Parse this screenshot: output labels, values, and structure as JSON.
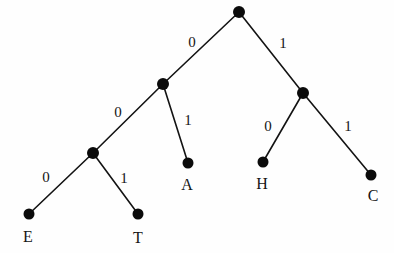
{
  "diagram": {
    "kind": "binary-code-tree",
    "title": "",
    "colors": {
      "background": "#fefefe",
      "node": "#0b0b0b",
      "edge": "#131313",
      "text": "#151515"
    },
    "nodes": [
      {
        "id": "root",
        "x": 239,
        "y": 12,
        "r": 6.0,
        "label": ""
      },
      {
        "id": "n-l",
        "x": 163,
        "y": 84,
        "r": 6.0,
        "label": ""
      },
      {
        "id": "n-r",
        "x": 303,
        "y": 93,
        "r": 6.0,
        "label": ""
      },
      {
        "id": "n-ll",
        "x": 93,
        "y": 153,
        "r": 6.0,
        "label": ""
      },
      {
        "id": "leaf-e",
        "x": 29,
        "y": 214,
        "r": 5.5,
        "label": "E"
      },
      {
        "id": "leaf-t",
        "x": 138,
        "y": 214,
        "r": 5.5,
        "label": "T"
      },
      {
        "id": "leaf-a",
        "x": 188,
        "y": 163,
        "r": 5.5,
        "label": "A"
      },
      {
        "id": "leaf-h",
        "x": 263,
        "y": 162,
        "r": 5.5,
        "label": "H"
      },
      {
        "id": "leaf-c",
        "x": 371,
        "y": 175,
        "r": 5.5,
        "label": "C"
      }
    ],
    "edges": [
      {
        "id": "e-root-l",
        "from": "root",
        "to": "n-l",
        "label": "0",
        "lx": 192,
        "ly": 42
      },
      {
        "id": "e-root-r",
        "from": "root",
        "to": "n-r",
        "label": "1",
        "lx": 283,
        "ly": 43
      },
      {
        "id": "e-l-ll",
        "from": "n-l",
        "to": "n-ll",
        "label": "0",
        "lx": 118,
        "ly": 112
      },
      {
        "id": "e-l-a",
        "from": "n-l",
        "to": "leaf-a",
        "label": "1",
        "lx": 188,
        "ly": 120
      },
      {
        "id": "e-ll-e",
        "from": "n-ll",
        "to": "leaf-e",
        "label": "0",
        "lx": 46,
        "ly": 177
      },
      {
        "id": "e-ll-t",
        "from": "n-ll",
        "to": "leaf-t",
        "label": "1",
        "lx": 124,
        "ly": 178
      },
      {
        "id": "e-r-h",
        "from": "n-r",
        "to": "leaf-h",
        "label": "0",
        "lx": 268,
        "ly": 126
      },
      {
        "id": "e-r-c",
        "from": "n-r",
        "to": "leaf-c",
        "label": "1",
        "lx": 348,
        "ly": 126
      }
    ],
    "leaf_labels": [
      {
        "id": "label-e",
        "text": "E",
        "x": 28,
        "y": 237
      },
      {
        "id": "label-t",
        "text": "T",
        "x": 138,
        "y": 238
      },
      {
        "id": "label-a",
        "text": "A",
        "x": 187,
        "y": 185
      },
      {
        "id": "label-h",
        "text": "H",
        "x": 262,
        "y": 184
      },
      {
        "id": "label-c",
        "text": "C",
        "x": 373,
        "y": 196
      }
    ],
    "codes": [
      {
        "symbol": "E",
        "code": "000"
      },
      {
        "symbol": "T",
        "code": "001"
      },
      {
        "symbol": "A",
        "code": "01"
      },
      {
        "symbol": "H",
        "code": "10"
      },
      {
        "symbol": "C",
        "code": "11"
      }
    ]
  }
}
